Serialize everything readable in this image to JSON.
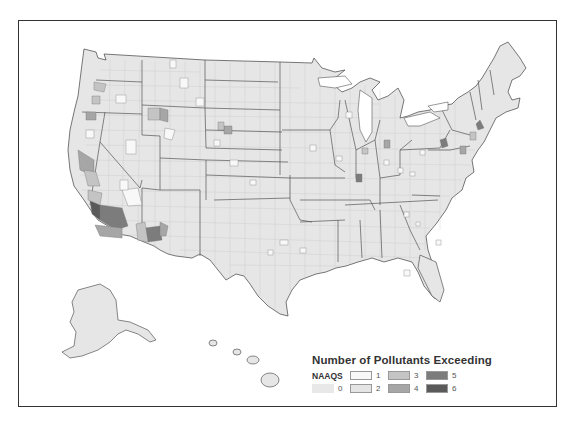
{
  "map": {
    "type": "choropleth",
    "region": "United States counties (incl. Alaska, Hawaii)",
    "colors": {
      "land": "#e6e6e6",
      "border_state": "#555555",
      "border_county": "#bdbdbd",
      "frame": "#333333"
    }
  },
  "legend": {
    "title": "Number of Pollutants Exceeding",
    "subtitle": "NAAQS",
    "items": [
      {
        "value": "0",
        "color": "#e8e8e8"
      },
      {
        "value": "1",
        "color": "#f8f8f8"
      },
      {
        "value": "2",
        "color": "#e4e4e4"
      },
      {
        "value": "3",
        "color": "#c4c4c4"
      },
      {
        "value": "4",
        "color": "#a6a6a6"
      },
      {
        "value": "5",
        "color": "#7c7c7c"
      },
      {
        "value": "6",
        "color": "#5a5a5a"
      }
    ]
  }
}
